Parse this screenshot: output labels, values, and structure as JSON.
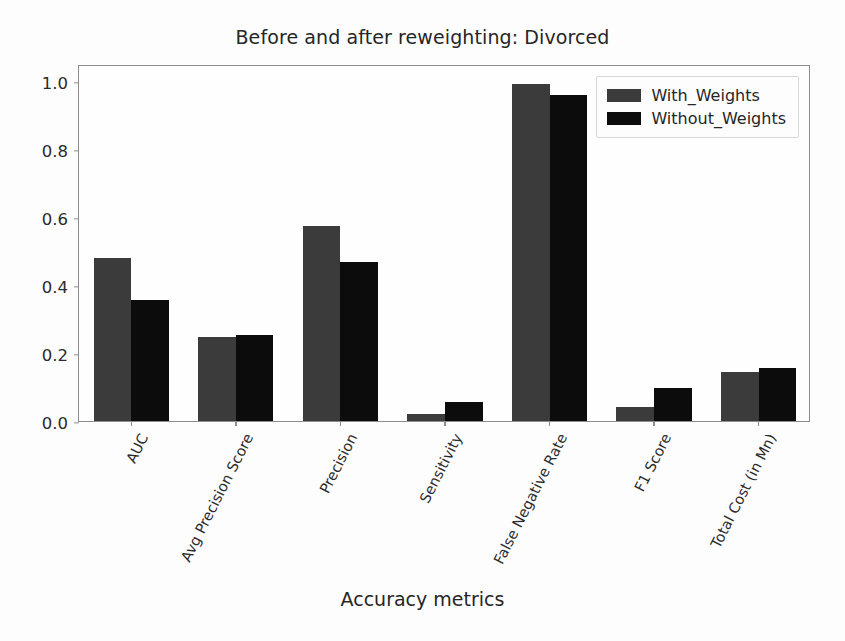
{
  "chart_data": {
    "type": "bar",
    "title": "Before and after reweighting: Divorced",
    "xlabel": "Accuracy metrics",
    "ylabel": "",
    "categories": [
      "AUC",
      "Avg Precision Score",
      "Precision",
      "Sensitivity",
      "False Negative Rate",
      "F1 Score",
      "Total Cost (in Mn)"
    ],
    "series": [
      {
        "name": "With_Weights",
        "color": "#3b3b3b",
        "values": [
          0.48,
          0.248,
          0.575,
          0.022,
          0.99,
          0.04,
          0.145
        ]
      },
      {
        "name": "Without_Weights",
        "color": "#0c0c0c",
        "values": [
          0.355,
          0.254,
          0.468,
          0.055,
          0.958,
          0.098,
          0.155
        ]
      }
    ],
    "ylim": [
      0.0,
      1.05
    ],
    "yticks": [
      "0.0",
      "0.2",
      "0.4",
      "0.6",
      "0.8",
      "1.0"
    ],
    "ytick_values": [
      0.0,
      0.2,
      0.4,
      0.6,
      0.8,
      1.0
    ],
    "grid": false,
    "legend_position": "upper right"
  }
}
